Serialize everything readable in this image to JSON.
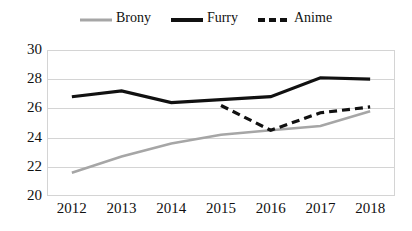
{
  "chart_data": {
    "type": "line",
    "title": "",
    "xlabel": "",
    "ylabel": "",
    "categories": [
      "2012",
      "2013",
      "2014",
      "2015",
      "2016",
      "2017",
      "2018"
    ],
    "ylim": [
      20,
      30
    ],
    "yticks": [
      "20",
      "22",
      "24",
      "26",
      "28",
      "30"
    ],
    "grid": true,
    "legend_position": "top-center",
    "series": [
      {
        "name": "Brony",
        "color": "#a6a6a6",
        "style": "solid",
        "values": [
          21.6,
          22.7,
          23.6,
          24.2,
          24.5,
          24.8,
          25.8
        ]
      },
      {
        "name": "Furry",
        "color": "#111111",
        "style": "solid",
        "values": [
          26.8,
          27.2,
          26.4,
          26.6,
          26.8,
          28.1,
          28.0
        ]
      },
      {
        "name": "Anime",
        "color": "#111111",
        "style": "dashed",
        "values": [
          null,
          null,
          null,
          26.2,
          24.5,
          25.7,
          26.1
        ]
      }
    ]
  }
}
